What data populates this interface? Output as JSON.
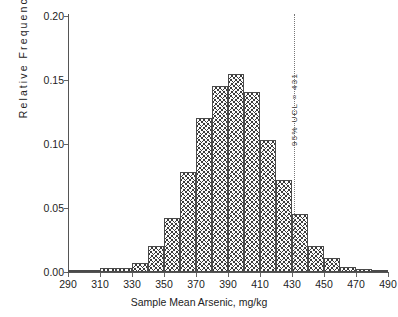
{
  "chart_data": {
    "type": "bar",
    "title": "",
    "subtitle": "",
    "xlabel": "Sample Mean Arsenic, mg/kg",
    "ylabel": "R e l a t i v e   F r e q u e n c y",
    "ylabel_plain": "Relative Frequency",
    "xlim": [
      290,
      490
    ],
    "ylim": [
      0.0,
      0.2
    ],
    "grid": false,
    "legend": null,
    "bin_width": 10,
    "xticks": [
      290,
      310,
      330,
      350,
      370,
      390,
      410,
      430,
      450,
      470,
      490
    ],
    "xtick_labels": [
      "290",
      "310",
      "330",
      "350",
      "370",
      "390",
      "410",
      "430",
      "450",
      "470",
      "490"
    ],
    "yticks": [
      0.0,
      0.05,
      0.1,
      0.15,
      0.2
    ],
    "ytick_labels": [
      "0.00",
      "0.05",
      "0.10",
      "0.15",
      "0.20"
    ],
    "bin_starts": [
      290,
      300,
      310,
      320,
      330,
      340,
      350,
      360,
      370,
      380,
      390,
      400,
      410,
      420,
      430,
      440,
      450,
      460,
      470,
      480
    ],
    "bin_centers": [
      295,
      305,
      315,
      325,
      335,
      345,
      355,
      365,
      375,
      385,
      395,
      405,
      415,
      425,
      435,
      445,
      455,
      465,
      475,
      485
    ],
    "values": [
      0.0,
      0.001,
      0.003,
      0.003,
      0.007,
      0.02,
      0.042,
      0.078,
      0.12,
      0.145,
      0.155,
      0.141,
      0.103,
      0.072,
      0.045,
      0.02,
      0.011,
      0.004,
      0.002,
      0.001
    ],
    "annotations": [
      {
        "name": "ucl-line",
        "text": "9 5 %   U C L   =   4 3 1",
        "text_plain": "95% UCL = 431",
        "x": 431,
        "style": "dotted vertical line",
        "orientation": "vertical"
      }
    ]
  },
  "colors": {
    "axis": "#555555",
    "text": "#232323",
    "bar_edge": "#4a4a4a",
    "bar_hatch": "#3b3b3b",
    "bar_fill": "#fdfdfd",
    "annotation_line": "#777777"
  }
}
